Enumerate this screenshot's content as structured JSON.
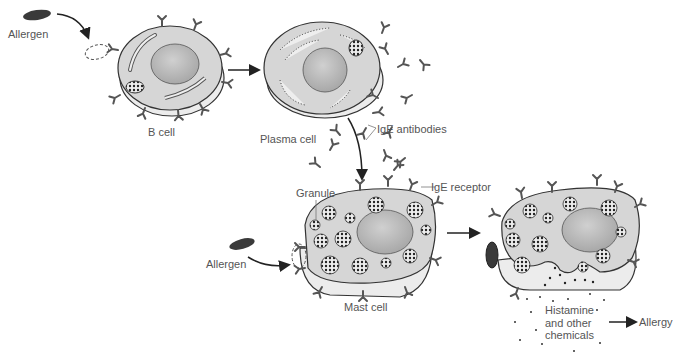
{
  "title_fragment": "",
  "labels": {
    "allergen_top": "Allergen",
    "b_cell": "B cell",
    "plasma_cell": "Plasma cell",
    "ige_antibodies": "IgE antibodies",
    "granule": "Granule",
    "ige_receptor": "IgE receptor",
    "allergen_bottom": "Allergen",
    "mast_cell": "Mast cell",
    "histamine_line1": "Histamine",
    "histamine_line2": "and other",
    "histamine_line3": "chemicals",
    "allergy": "Allergy"
  },
  "colors": {
    "cell_fill": "#d6d6d6",
    "cell_base": "#ececec",
    "nucleus": "#bdbdbd",
    "outline": "#333333",
    "allergen": "#3a3a3a",
    "label_text": "#555555"
  }
}
